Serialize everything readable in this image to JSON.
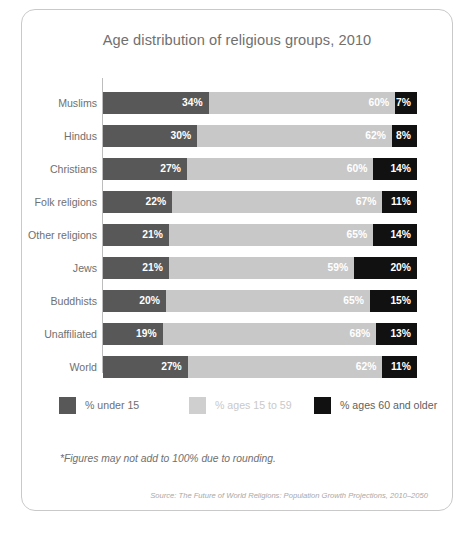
{
  "card": {
    "title": "Age distribution of religious groups, 2010",
    "footnote": "*Figures may not add to 100% due to rounding.",
    "source": "Source: The Future of World Religions: Population Growth Projections, 2010–2050"
  },
  "legend": {
    "items": [
      {
        "label": "% under 15",
        "color": "#585858"
      },
      {
        "label": "% ages 15 to 59",
        "color": "#cfcfcf"
      },
      {
        "label": "% ages 60 and older",
        "color": "#111111"
      }
    ]
  },
  "chart_data": {
    "type": "bar",
    "orientation": "horizontal",
    "stacked": true,
    "normalized_percent": true,
    "title": "Age distribution of religious groups, 2010",
    "xlabel": "",
    "ylabel": "",
    "xlim": [
      0,
      100
    ],
    "grid": false,
    "legend_position": "bottom",
    "categories": [
      "Muslims",
      "Hindus",
      "Christians",
      "Folk religions",
      "Other religions",
      "Jews",
      "Buddhists",
      "Unaffiliated",
      "World"
    ],
    "series": [
      {
        "name": "% under 15",
        "color": "#585858",
        "values": [
          34,
          30,
          27,
          22,
          21,
          21,
          20,
          19,
          27
        ]
      },
      {
        "name": "% ages 15 to 59",
        "color": "#c8c8c8",
        "values": [
          60,
          62,
          60,
          67,
          65,
          59,
          65,
          68,
          62
        ]
      },
      {
        "name": "% ages 60 and older",
        "color": "#111111",
        "values": [
          7,
          8,
          14,
          11,
          14,
          20,
          15,
          13,
          11
        ]
      }
    ],
    "value_labels": [
      [
        "34%",
        "60%",
        "7%"
      ],
      [
        "30%",
        "62%",
        "8%"
      ],
      [
        "27%",
        "60%",
        "14%"
      ],
      [
        "22%",
        "67%",
        "11%"
      ],
      [
        "21%",
        "65%",
        "14%"
      ],
      [
        "21%",
        "59%",
        "20%"
      ],
      [
        "20%",
        "65%",
        "15%"
      ],
      [
        "19%",
        "68%",
        "13%"
      ],
      [
        "27%",
        "62%",
        "11%"
      ]
    ]
  }
}
